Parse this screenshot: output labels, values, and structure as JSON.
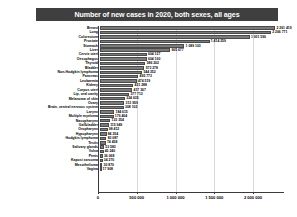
{
  "chart_data": {
    "type": "bar",
    "orientation": "horizontal",
    "title": "Number of new cases in 2020, both sexes, all ages",
    "xlabel": "",
    "ylabel": "",
    "xlim": [
      0,
      2400000
    ],
    "grid": true,
    "legend": null,
    "xticks": [
      "0",
      "500 000",
      "1 000 000",
      "1 500 000",
      "2 000 000"
    ],
    "xtick_values": [
      0,
      500000,
      1000000,
      1500000,
      2000000
    ],
    "categories": [
      "Breast",
      "Lung",
      "Colorectum",
      "Prostate",
      "Stomach",
      "Liver",
      "Cervix uteri",
      "Oesophagus",
      "Thyroid",
      "Bladder",
      "Non-Hodgkin lymphoma",
      "Pancreas",
      "Leukaemia",
      "Kidney",
      "Corpus uteri",
      "Lip, oral cavity",
      "Melanoma of skin",
      "Ovary",
      "Brain, central nervous system",
      "Larynx",
      "Multiple myeloma",
      "Nasopharynx",
      "Gallbladder",
      "Oropharynx",
      "Hypopharynx",
      "Hodgkin lymphoma",
      "Testis",
      "Salivary glands",
      "Vulva",
      "Penis",
      "Kaposi sarcoma",
      "Mesothelioma",
      "Vagina"
    ],
    "values": [
      2261419,
      2206771,
      1931590,
      1414259,
      1089103,
      905677,
      604127,
      604100,
      586202,
      573278,
      544352,
      495773,
      474519,
      431288,
      417367,
      377713,
      324635,
      313959,
      308102,
      184615,
      176404,
      133354,
      115949,
      98412,
      84254,
      83087,
      74458,
      53583,
      45240,
      36068,
      34270,
      30870,
      17908
    ],
    "value_labels": [
      "2 261 419",
      "2 206 771",
      "1 931 590",
      "1 414 259",
      "1 089 103",
      "905 677",
      "604 127",
      "604 100",
      "586 202",
      "573 278",
      "544 352",
      "495 773",
      "474 519",
      "431 288",
      "417 367",
      "377 713",
      "324 635",
      "313 959",
      "308 102",
      "184 615",
      "176 404",
      "133 354",
      "115 949",
      "98 412",
      "84 254",
      "83 087",
      "74 458",
      "53 583",
      "45 240",
      "36 068",
      "34 270",
      "30 870",
      "17 908"
    ],
    "colors": {
      "bar_fill": "#7b7b7b",
      "bar_edge": "#4a4a4a",
      "title_background": "#3f3f3f",
      "title_text": "#ffffff",
      "grid": "#d9d9d9",
      "axis": "#3a3a3a",
      "text": "#000000",
      "plot_background": "#ffffff"
    }
  }
}
